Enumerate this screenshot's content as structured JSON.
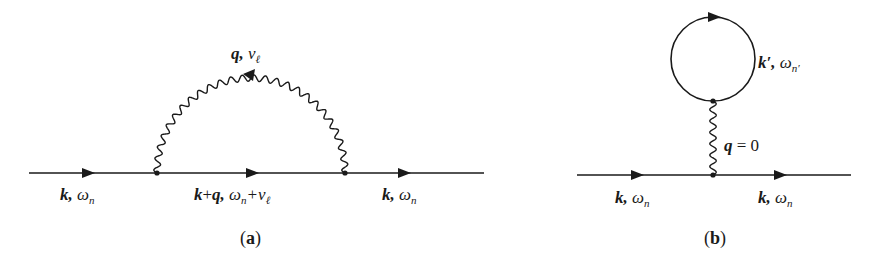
{
  "diagrams": [
    {
      "id": "a",
      "caption": "(a)",
      "caption_letter": "a",
      "description": "Fock (exchange) self-energy diagram: fermion line with a wavy interaction line connecting two vertices",
      "colors": {
        "line": "#1a1a1a",
        "background": "#ffffff"
      },
      "labels": {
        "incoming": {
          "momentum": "k",
          "sep": ",",
          "freq": "ω",
          "freq_sub": "n"
        },
        "internal": {
          "momentum": "k+q",
          "momentum_k": "k",
          "plus": "+",
          "momentum_q": "q",
          "sep": ",",
          "freq": "ω",
          "freq_sub": "n",
          "freq_plus": "+ν",
          "freq_plus_sub": "ℓ"
        },
        "outgoing": {
          "momentum": "k",
          "sep": ",",
          "freq": "ω",
          "freq_sub": "n"
        },
        "boson": {
          "momentum": "q",
          "sep": ",",
          "freq": "ν",
          "freq_sub": "ℓ"
        }
      }
    },
    {
      "id": "b",
      "caption": "(b)",
      "caption_letter": "b",
      "description": "Hartree (tadpole) self-energy diagram: fermion loop attached by a zero-momentum wavy line",
      "colors": {
        "line": "#1a1a1a",
        "background": "#ffffff"
      },
      "labels": {
        "incoming": {
          "momentum": "k",
          "sep": ",",
          "freq": "ω",
          "freq_sub": "n"
        },
        "outgoing": {
          "momentum": "k",
          "sep": ",",
          "freq": "ω",
          "freq_sub": "n"
        },
        "loop": {
          "momentum": "k′",
          "sep": ",",
          "freq": "ω",
          "freq_sub": "n′"
        },
        "boson": {
          "momentum": "q",
          "eq": "= 0"
        }
      }
    }
  ]
}
